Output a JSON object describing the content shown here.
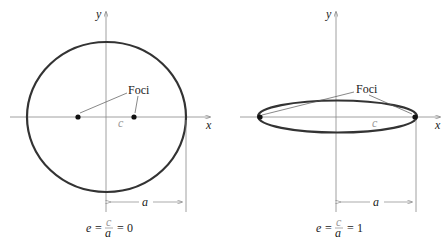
{
  "diagrams": [
    {
      "name": "circle",
      "axes": {
        "x_label": "x",
        "y_label": "y"
      },
      "foci_label": "Foci",
      "c_label": "c",
      "a_label": "a",
      "equation": {
        "lhs": "e",
        "num": "c",
        "den": "a",
        "rhs": "0"
      }
    },
    {
      "name": "flat-ellipse",
      "axes": {
        "x_label": "x",
        "y_label": "y"
      },
      "foci_label": "Foci",
      "c_label": "c",
      "a_label": "a",
      "equation": {
        "lhs": "e",
        "num": "c",
        "den": "a",
        "rhs": "1"
      }
    }
  ],
  "colors": {
    "curve": "#333333",
    "axis": "#888888",
    "text": "#222222"
  }
}
